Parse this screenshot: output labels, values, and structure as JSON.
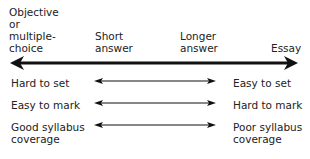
{
  "header": {
    "col1": "Objective\nor\nmultiple-\nchoice",
    "col2": "Short\nanswer",
    "col3": "Longer\nanswer",
    "col4": "Essay"
  },
  "rows": [
    {
      "left": "Hard to set",
      "right": "Easy to set"
    },
    {
      "left": "Easy to mark",
      "right": "Hard to mark"
    },
    {
      "left": "Good syllabus\ncoverage",
      "right": "Poor syllabus\ncoverage"
    }
  ]
}
